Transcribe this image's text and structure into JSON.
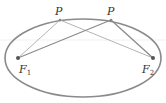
{
  "diagram": {
    "type": "ellipse-foci",
    "ellipse": {
      "cx": 83,
      "cy": 58,
      "rx": 78,
      "ry": 39,
      "stroke": "#8a8a8a"
    },
    "foci": [
      {
        "label": "F",
        "subscript": "1",
        "x": 18,
        "y": 58
      },
      {
        "label": "F",
        "subscript": "2",
        "x": 153,
        "y": 58
      }
    ],
    "points": [
      {
        "label": "P",
        "x": 60,
        "y": 20
      },
      {
        "label": "P",
        "x": 111,
        "y": 20
      }
    ],
    "line_color_light": "#b5b5b5",
    "line_color_dark": "#8a8a8a",
    "point_color": "#555555"
  }
}
